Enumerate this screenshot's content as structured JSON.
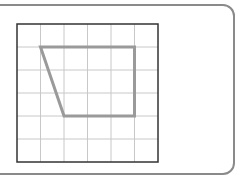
{
  "diagram": {
    "type": "grid-shape",
    "grid": {
      "columns": 6,
      "rows": 6
    },
    "shape": {
      "name": "trapezoid",
      "vertices": [
        [
          1,
          1
        ],
        [
          5,
          1
        ],
        [
          5,
          4
        ],
        [
          2,
          4
        ]
      ]
    },
    "colors": {
      "frame": "#8a8a8a",
      "grid_line": "#c8c8c8",
      "grid_border": "#333333",
      "shape_stroke": "#9a9a9a"
    }
  }
}
